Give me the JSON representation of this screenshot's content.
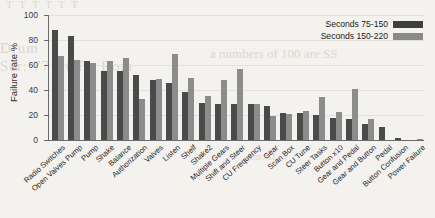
{
  "chart_data": {
    "type": "bar",
    "title": "",
    "xlabel": "",
    "ylabel": "Failure rate %",
    "ylim": [
      0,
      100
    ],
    "yticks": [
      0,
      20,
      40,
      60,
      80,
      100
    ],
    "grid": true,
    "legend_position": "top-right",
    "categories": [
      "Radio Switches",
      "Open Valves Pump",
      "Pump",
      "Shake",
      "Balance",
      "Authorization",
      "Valves",
      "Listen",
      "Shelf",
      "Shake2",
      "Multiple Gears",
      "Shift and Steer",
      "CU Frequency",
      "Gear",
      "Scan Box",
      "CU Tune",
      "Steer Tasks",
      "Button x10",
      "Gear and Pedal",
      "Gear and Button",
      "Pedal",
      "Button Confusion",
      "Power Failure"
    ],
    "series": [
      {
        "name": "Seconds 75-150",
        "color": "#4a4a4a",
        "values": [
          88,
          83,
          63,
          55.5,
          55.5,
          52,
          48,
          46,
          38.5,
          29.5,
          28.5,
          28.5,
          28.5,
          27,
          21.5,
          21.5,
          20,
          18,
          16.5,
          12.5,
          10.5,
          2,
          0
        ]
      },
      {
        "name": "Seconds 150-220",
        "color": "#8c8c8c",
        "values": [
          67,
          64,
          62,
          63,
          65.5,
          33,
          49,
          69,
          49.5,
          35.5,
          48,
          56.5,
          29,
          19.5,
          21,
          23.5,
          34.5,
          22.5,
          41,
          17,
          0,
          0,
          0.5
        ]
      }
    ]
  },
  "legend": {
    "items": [
      {
        "label": "Seconds 75-150"
      },
      {
        "label": "Seconds 150-220"
      }
    ]
  },
  "background_bleed": {
    "line1": "T  T  T   T   T  T",
    "line2": "Drum",
    "line3": "Ser: 77 fit     Tir Rom",
    "line4": "a numbers of 100 are SS",
    "line5": "tur: II"
  }
}
